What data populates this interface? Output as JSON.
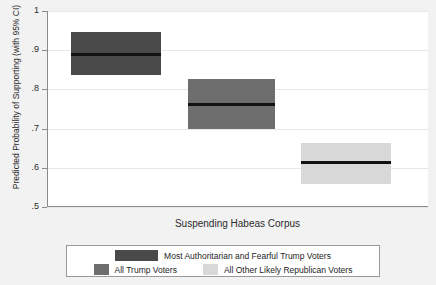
{
  "chart_data": {
    "type": "bar",
    "title": "",
    "xlabel": "Suspending Habeas Corpus",
    "ylabel": "Predicted Probability of Supporting (with 95% CI)",
    "ylim": [
      0.5,
      1.0
    ],
    "yticks": [
      "1",
      ".9",
      ".8",
      ".7",
      ".6",
      ".5"
    ],
    "ytick_values": [
      1.0,
      0.9,
      0.8,
      0.7,
      0.6,
      0.5
    ],
    "grid": true,
    "legend_position": "bottom",
    "categories": [
      "Most Authoritarian and Fearful Trump Voters",
      "All Trump Voters",
      "All Other Likely Republican Voters"
    ],
    "series": [
      {
        "name": "Most Authoritarian and Fearful Trump Voters",
        "estimate": 0.89,
        "ci_low": 0.837,
        "ci_high": 0.947,
        "color": "#4a4a4a"
      },
      {
        "name": "All Trump Voters",
        "estimate": 0.762,
        "ci_low": 0.698,
        "ci_high": 0.826,
        "color": "#6e6e6e"
      },
      {
        "name": "All Other Likely Republican Voters",
        "estimate": 0.615,
        "ci_low": 0.559,
        "ci_high": 0.663,
        "color": "#d8d8d8"
      }
    ]
  },
  "axis": {
    "ylabel": "Predicted Probability of Supporting (with 95% CI)",
    "xlabel": "Suspending Habeas Corpus",
    "ticks": [
      {
        "label": "1"
      },
      {
        "label": ".9"
      },
      {
        "label": ".8"
      },
      {
        "label": ".7"
      },
      {
        "label": ".6"
      },
      {
        "label": ".5"
      }
    ]
  },
  "legend": {
    "items": [
      {
        "label": "Most Authoritarian and Fearful Trump Voters",
        "color": "#4a4a4a"
      },
      {
        "label": "All Trump Voters",
        "color": "#6e6e6e"
      },
      {
        "label": "All Other Likely Republican Voters",
        "color": "#d8d8d8"
      }
    ]
  }
}
